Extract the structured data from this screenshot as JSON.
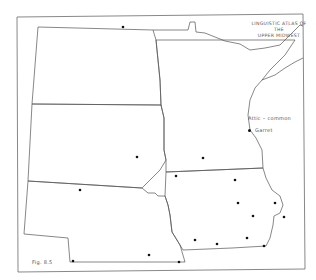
{
  "map": {
    "title_line1": "LINGUISTIC ATLAS OF THE",
    "title_line2": "UPPER MIDWEST",
    "figure_label": "Fig. 8.5",
    "legend": {
      "title": "Attic – common",
      "items": [
        {
          "symbol": "dot",
          "label": "Garret"
        }
      ]
    },
    "states": [
      "North Dakota",
      "South Dakota",
      "Nebraska",
      "Minnesota",
      "Iowa"
    ],
    "colors": {
      "lines": "#555555",
      "dots": "#111111"
    },
    "dots": [
      {
        "x": 123,
        "y": 27
      },
      {
        "x": 137,
        "y": 157
      },
      {
        "x": 203,
        "y": 158
      },
      {
        "x": 80,
        "y": 190
      },
      {
        "x": 176,
        "y": 176
      },
      {
        "x": 235,
        "y": 180
      },
      {
        "x": 238,
        "y": 203
      },
      {
        "x": 253,
        "y": 216
      },
      {
        "x": 275,
        "y": 203
      },
      {
        "x": 284,
        "y": 217
      },
      {
        "x": 195,
        "y": 240
      },
      {
        "x": 217,
        "y": 244
      },
      {
        "x": 247,
        "y": 238
      },
      {
        "x": 264,
        "y": 246
      },
      {
        "x": 73,
        "y": 261
      },
      {
        "x": 149,
        "y": 255
      },
      {
        "x": 179,
        "y": 262
      }
    ]
  }
}
